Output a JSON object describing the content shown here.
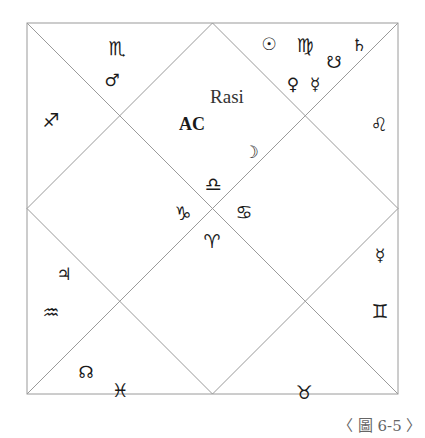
{
  "chart": {
    "title": "Rasi",
    "ascendant_label": "AC",
    "caption": "〈 圖 6-5 〉",
    "line_color": "#9a9a9a",
    "houses": [
      {
        "house": 1,
        "sign": "Libra",
        "sign_glyph": "♎",
        "planets": [
          {
            "name": "Moon",
            "glyph": "☽"
          }
        ],
        "extra": "AC"
      },
      {
        "house": 2,
        "sign": "Scorpio",
        "sign_glyph": "♏",
        "planets": [
          {
            "name": "Mars",
            "glyph": "♂"
          }
        ]
      },
      {
        "house": 3,
        "sign": "Sagittarius",
        "sign_glyph": "♐",
        "planets": []
      },
      {
        "house": 4,
        "sign": "Capricorn",
        "sign_glyph": "♑",
        "planets": []
      },
      {
        "house": 5,
        "sign": "Aquarius",
        "sign_glyph": "♒",
        "planets": [
          {
            "name": "Jupiter",
            "glyph": "♃"
          }
        ]
      },
      {
        "house": 6,
        "sign": "Pisces",
        "sign_glyph": "♓",
        "planets": [
          {
            "name": "Rahu",
            "glyph": "☊"
          }
        ]
      },
      {
        "house": 7,
        "sign": "Aries",
        "sign_glyph": "♈",
        "planets": []
      },
      {
        "house": 8,
        "sign": "Taurus",
        "sign_glyph": "♉",
        "planets": []
      },
      {
        "house": 9,
        "sign": "Gemini",
        "sign_glyph": "♊",
        "planets": []
      },
      {
        "house": 10,
        "sign": "Cancer",
        "sign_glyph": "♋",
        "planets": [
          {
            "name": "Mercury",
            "glyph": "☿"
          }
        ]
      },
      {
        "house": 11,
        "sign": "Leo",
        "sign_glyph": "♌",
        "planets": []
      },
      {
        "house": 12,
        "sign": "Virgo",
        "sign_glyph": "♍",
        "planets": [
          {
            "name": "Sun",
            "glyph": "☉"
          },
          {
            "name": "Ketu",
            "glyph": "☋"
          },
          {
            "name": "Saturn",
            "glyph": "♄"
          },
          {
            "name": "Venus",
            "glyph": "♀"
          },
          {
            "name": "Mercury",
            "glyph": "☿"
          }
        ]
      }
    ]
  }
}
